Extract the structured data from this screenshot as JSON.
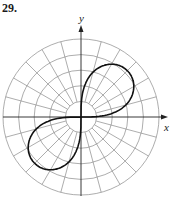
{
  "problem": {
    "number": "29."
  },
  "axes": {
    "x_label": "x",
    "y_label": "y"
  },
  "colors": {
    "grid": "#8a8a8a",
    "axis": "#222222",
    "curve": "#111111"
  },
  "chart_data": {
    "type": "polar",
    "title": "29.",
    "xlabel": "x",
    "ylabel": "y",
    "grid": {
      "rings": 5,
      "radial_spacing_deg": 15,
      "inner_circle_has_no_spokes": true
    },
    "curve": "lemniscate r^2 = a^2 sin(2θ), loops in quadrants I and III",
    "a_in_ring_units": 4.2
  }
}
